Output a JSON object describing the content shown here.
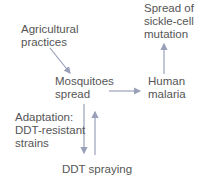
{
  "diagram": {
    "nodes": {
      "sickle_cell": "Spread of\nsickle-cell\nmutation",
      "agricultural": "Agricultural\npractices",
      "mosquitoes": "Mosquitoes\nspread",
      "malaria": "Human\nmalaria",
      "adaptation": "Adaptation:\nDDT-resistant\nstrains",
      "ddt": "DDT spraying"
    },
    "edges": [
      {
        "from": "agricultural",
        "to": "mosquitoes"
      },
      {
        "from": "mosquitoes",
        "to": "malaria"
      },
      {
        "from": "malaria",
        "to": "sickle_cell"
      },
      {
        "from": "mosquitoes",
        "to": "ddt"
      },
      {
        "from": "ddt",
        "to": "mosquitoes"
      }
    ],
    "colors": {
      "arrow": "#9aa0b8",
      "text": "#555555"
    }
  }
}
